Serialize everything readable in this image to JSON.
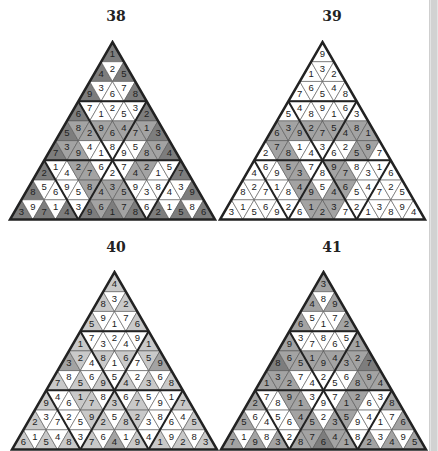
{
  "colors": {
    "shade0": "#ffffff",
    "shade1": "#c9c9c9",
    "shade2": "#a3a3a3",
    "shade3": "#7d7d7d",
    "line": "#222222",
    "thin": "#555555"
  },
  "scrollbar": {
    "visible": true
  },
  "puzzles": [
    {
      "number": "38",
      "title_pos": [
        100,
        8
      ],
      "apex": [
        112,
        42
      ],
      "side": 205,
      "rows": [
        {
          "digits": [
            1
          ],
          "shades": [
            3
          ]
        },
        {
          "digits": [
            4,
            2,
            5
          ],
          "shades": [
            3,
            0,
            3
          ]
        },
        {
          "digits": [
            9,
            3,
            6,
            7,
            8
          ],
          "shades": [
            3,
            0,
            0,
            0,
            3
          ]
        },
        {
          "digits": [
            6,
            7,
            1,
            2,
            5,
            3,
            2
          ],
          "shades": [
            3,
            0,
            0,
            0,
            0,
            0,
            3
          ]
        },
        {
          "digits": [
            5,
            8,
            2,
            9,
            6,
            4,
            7,
            1,
            3
          ],
          "shades": [
            3,
            2,
            2,
            2,
            2,
            2,
            2,
            2,
            3
          ]
        },
        {
          "digits": [
            7,
            3,
            9,
            4,
            1,
            8,
            9,
            5,
            8,
            6,
            4
          ],
          "shades": [
            3,
            2,
            2,
            0,
            0,
            0,
            0,
            0,
            2,
            2,
            3
          ]
        },
        {
          "digits": [
            2,
            1,
            4,
            2,
            7,
            6,
            2,
            7,
            4,
            2,
            1,
            5,
            7
          ],
          "shades": [
            3,
            0,
            0,
            2,
            2,
            0,
            0,
            0,
            2,
            2,
            0,
            0,
            3
          ]
        },
        {
          "digits": [
            8,
            5,
            6,
            9,
            5,
            8,
            4,
            3,
            5,
            9,
            3,
            8,
            4,
            3,
            9
          ],
          "shades": [
            3,
            0,
            0,
            0,
            0,
            2,
            2,
            2,
            2,
            0,
            0,
            0,
            0,
            0,
            3
          ]
        },
        {
          "digits": [
            3,
            9,
            7,
            1,
            4,
            3,
            9,
            6,
            1,
            7,
            8,
            6,
            2,
            1,
            5,
            8,
            6
          ],
          "shades": [
            3,
            0,
            3,
            0,
            3,
            0,
            3,
            2,
            3,
            2,
            3,
            0,
            3,
            0,
            3,
            0,
            3
          ]
        }
      ]
    },
    {
      "number": "39",
      "title_pos": [
        316,
        8
      ],
      "apex": [
        322,
        42
      ],
      "side": 205,
      "rows": [
        {
          "digits": [
            9
          ],
          "shades": [
            0
          ]
        },
        {
          "digits": [
            1,
            3,
            2
          ],
          "shades": [
            0,
            0,
            0
          ]
        },
        {
          "digits": [
            7,
            6,
            5,
            4,
            8
          ],
          "shades": [
            0,
            0,
            0,
            0,
            0
          ]
        },
        {
          "digits": [
            5,
            4,
            8,
            9,
            1,
            6,
            3
          ],
          "shades": [
            0,
            0,
            0,
            0,
            0,
            0,
            0
          ]
        },
        {
          "digits": [
            6,
            3,
            9,
            2,
            7,
            5,
            4,
            8,
            1
          ],
          "shades": [
            2,
            2,
            2,
            2,
            2,
            2,
            2,
            2,
            2
          ]
        },
        {
          "digits": [
            2,
            7,
            8,
            1,
            4,
            3,
            6,
            2,
            5,
            9,
            7
          ],
          "shades": [
            0,
            2,
            2,
            0,
            0,
            0,
            0,
            0,
            2,
            2,
            0
          ]
        },
        {
          "digits": [
            4,
            6,
            9,
            5,
            3,
            7,
            8,
            9,
            7,
            8,
            3,
            1,
            6
          ],
          "shades": [
            0,
            0,
            0,
            2,
            2,
            0,
            0,
            2,
            2,
            0,
            0,
            0,
            0
          ]
        },
        {
          "digits": [
            8,
            2,
            7,
            1,
            8,
            4,
            9,
            5,
            4,
            6,
            5,
            4,
            7,
            2,
            5
          ],
          "shades": [
            0,
            0,
            0,
            0,
            0,
            2,
            2,
            0,
            2,
            2,
            0,
            0,
            0,
            0,
            0
          ]
        },
        {
          "digits": [
            3,
            1,
            5,
            6,
            9,
            2,
            6,
            1,
            2,
            3,
            7,
            2,
            1,
            3,
            8,
            9,
            4
          ],
          "shades": [
            0,
            0,
            0,
            0,
            0,
            0,
            0,
            2,
            2,
            2,
            0,
            0,
            0,
            0,
            0,
            0,
            0
          ]
        }
      ]
    },
    {
      "number": "40",
      "title_pos": [
        100,
        239
      ],
      "apex": [
        114,
        272
      ],
      "side": 205,
      "rows": [
        {
          "digits": [
            4
          ],
          "shades": [
            1
          ]
        },
        {
          "digits": [
            8,
            3,
            2
          ],
          "shades": [
            1,
            0,
            1
          ]
        },
        {
          "digits": [
            5,
            9,
            1,
            7,
            6
          ],
          "shades": [
            1,
            0,
            0,
            0,
            1
          ]
        },
        {
          "digits": [
            1,
            7,
            3,
            2,
            4,
            9,
            1
          ],
          "shades": [
            1,
            0,
            0,
            0,
            0,
            0,
            1
          ]
        },
        {
          "digits": [
            3,
            2,
            4,
            8,
            1,
            6,
            7,
            5,
            9
          ],
          "shades": [
            2,
            1,
            0,
            1,
            0,
            1,
            0,
            1,
            2
          ]
        },
        {
          "digits": [
            7,
            8,
            5,
            6,
            9,
            5,
            4,
            2,
            3,
            6,
            8
          ],
          "shades": [
            1,
            0,
            1,
            0,
            1,
            0,
            1,
            0,
            1,
            0,
            1
          ]
        },
        {
          "digits": [
            9,
            4,
            6,
            1,
            7,
            8,
            3,
            6,
            7,
            5,
            9,
            1,
            7
          ],
          "shades": [
            1,
            0,
            0,
            1,
            1,
            0,
            1,
            0,
            1,
            0,
            0,
            0,
            1
          ]
        },
        {
          "digits": [
            2,
            3,
            7,
            2,
            5,
            9,
            2,
            5,
            8,
            2,
            3,
            8,
            6,
            4,
            5
          ],
          "shades": [
            1,
            0,
            0,
            0,
            0,
            1,
            1,
            0,
            1,
            1,
            0,
            0,
            0,
            0,
            1
          ]
        },
        {
          "digits": [
            6,
            1,
            5,
            4,
            8,
            3,
            7,
            6,
            4,
            1,
            9,
            4,
            1,
            9,
            2,
            8,
            3
          ],
          "shades": [
            1,
            0,
            1,
            0,
            1,
            0,
            1,
            0,
            2,
            0,
            1,
            0,
            1,
            0,
            1,
            0,
            1
          ]
        }
      ]
    },
    {
      "number": "41",
      "title_pos": [
        316,
        239
      ],
      "apex": [
        323,
        272
      ],
      "side": 205,
      "rows": [
        {
          "digits": [
            3
          ],
          "shades": [
            2
          ]
        },
        {
          "digits": [
            4,
            8,
            9
          ],
          "shades": [
            2,
            0,
            2
          ]
        },
        {
          "digits": [
            6,
            5,
            1,
            7,
            2
          ],
          "shades": [
            2,
            0,
            0,
            0,
            2
          ]
        },
        {
          "digits": [
            9,
            3,
            7,
            8,
            6,
            5,
            1
          ],
          "shades": [
            2,
            0,
            0,
            0,
            0,
            0,
            2
          ]
        },
        {
          "digits": [
            8,
            6,
            5,
            1,
            9,
            4,
            3,
            2,
            7
          ],
          "shades": [
            3,
            2,
            2,
            2,
            2,
            2,
            2,
            2,
            3
          ]
        },
        {
          "digits": [
            1,
            3,
            2,
            7,
            4,
            2,
            5,
            6,
            8,
            9,
            4
          ],
          "shades": [
            2,
            2,
            2,
            0,
            0,
            0,
            0,
            0,
            2,
            2,
            2
          ]
        },
        {
          "digits": [
            2,
            7,
            8,
            9,
            1,
            3,
            9,
            7,
            1,
            2,
            6,
            3,
            8
          ],
          "shades": [
            2,
            0,
            0,
            2,
            2,
            0,
            0,
            0,
            2,
            2,
            0,
            0,
            2
          ]
        },
        {
          "digits": [
            5,
            6,
            4,
            5,
            6,
            4,
            5,
            2,
            3,
            5,
            9,
            4,
            1,
            7,
            6
          ],
          "shades": [
            2,
            0,
            0,
            0,
            0,
            2,
            2,
            0,
            2,
            2,
            0,
            0,
            0,
            0,
            2
          ]
        },
        {
          "digits": [
            7,
            1,
            9,
            8,
            3,
            2,
            8,
            7,
            6,
            4,
            1,
            8,
            2,
            3,
            4,
            9,
            5
          ],
          "shades": [
            2,
            0,
            2,
            0,
            2,
            0,
            2,
            2,
            3,
            2,
            2,
            0,
            2,
            0,
            2,
            0,
            2
          ]
        }
      ]
    }
  ]
}
